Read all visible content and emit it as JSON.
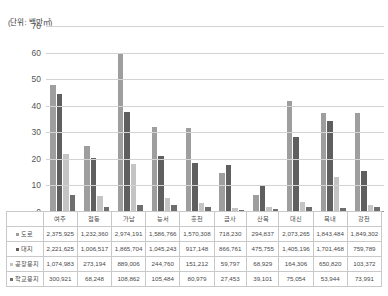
{
  "unit_caption": "(단위: 백만㎡)",
  "chart_data": {
    "type": "bar",
    "title": "",
    "xlabel": "",
    "ylabel": "",
    "unit_note": "(단위: 백만㎡)",
    "ylim": [
      0,
      70
    ],
    "yticks": [
      0,
      10,
      20,
      30,
      40,
      50,
      60,
      70
    ],
    "grid": true,
    "legend_position": "none",
    "categories": [
      "여주",
      "점동",
      "가남",
      "능서",
      "흥천",
      "금사",
      "산북",
      "대신",
      "북내",
      "강천"
    ],
    "series": [
      {
        "name": "도로",
        "color": "#9e9e9e",
        "values": [
          47.5,
          24.6,
          59.5,
          31.7,
          31.4,
          14.4,
          5.9,
          41.5,
          36.9,
          37.0
        ],
        "raw_values": [
          "2,375,925",
          "1,232,360",
          "2,974,191",
          "1,586,766",
          "1,570,308",
          "718,230",
          "294,837",
          "2,073,265",
          "1,843,484",
          "1,849,302"
        ]
      },
      {
        "name": "대지",
        "color": "#5f5f5f",
        "values": [
          44.4,
          20.1,
          37.3,
          20.9,
          18.3,
          17.3,
          9.5,
          28.1,
          34.0,
          15.2
        ],
        "raw_values": [
          "2,221,625",
          "1,006,517",
          "1,865,704",
          "1,045,243",
          "917,148",
          "866,761",
          "475,755",
          "1,405,196",
          "1,701,468",
          "759,789"
        ]
      },
      {
        "name": "공장용지",
        "color": "#c4c4c4",
        "values": [
          21.5,
          5.5,
          17.8,
          4.9,
          3.0,
          1.2,
          1.4,
          3.3,
          13.0,
          2.1
        ],
        "raw_values": [
          "1,074,983",
          "273,194",
          "889,006",
          "244,760",
          "151,212",
          "59,797",
          "68,929",
          "164,306",
          "650,820",
          "103,372"
        ]
      },
      {
        "name": "학교용지",
        "color": "#6e6e6e",
        "values": [
          6.0,
          1.4,
          2.2,
          2.1,
          1.6,
          0.5,
          0.8,
          1.5,
          1.1,
          1.5
        ],
        "raw_values": [
          "300,921",
          "68,248",
          "108,862",
          "105,484",
          "80,979",
          "27,453",
          "39,101",
          "75,054",
          "53,944",
          "73,991"
        ]
      }
    ]
  },
  "table": {
    "corner_label": "",
    "columns": [
      "여주",
      "점동",
      "가남",
      "능서",
      "흥천",
      "금사",
      "산북",
      "대신",
      "북내",
      "강천"
    ],
    "rows": [
      {
        "label": "도로",
        "cells": [
          "2,375,925",
          "1,232,360",
          "2,974,191",
          "1,586,766",
          "1,570,308",
          "718,230",
          "294,837",
          "2,073,265",
          "1,843,484",
          "1,849,302"
        ]
      },
      {
        "label": "대지",
        "cells": [
          "2,221,625",
          "1,006,517",
          "1,865,704",
          "1,045,243",
          "917,148",
          "866,761",
          "475,755",
          "1,405,196",
          "1,701,468",
          "759,789"
        ]
      },
      {
        "label": "공장용지",
        "cells": [
          "1,074,983",
          "273,194",
          "889,006",
          "244,760",
          "151,212",
          "59,797",
          "68,929",
          "164,306",
          "650,820",
          "103,372"
        ]
      },
      {
        "label": "학교용지",
        "cells": [
          "300,921",
          "68,248",
          "108,862",
          "105,484",
          "80,979",
          "27,453",
          "39,101",
          "75,054",
          "53,944",
          "73,991"
        ]
      }
    ]
  }
}
